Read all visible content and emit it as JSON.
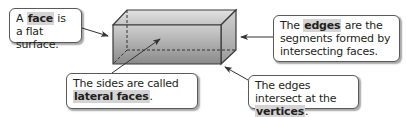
{
  "diagram": {
    "callouts": {
      "face": {
        "pre": "A ",
        "term": "face",
        "post": " is a flat surface."
      },
      "edges": {
        "pre": "The ",
        "term": "edges",
        "post": " are the segments formed by intersecting faces."
      },
      "lateral": {
        "pre": "The sides are called ",
        "term": "lateral faces",
        "post": "."
      },
      "vertices": {
        "pre": "The edges intersect at the ",
        "term": "vertices",
        "post": "."
      }
    },
    "colors": {
      "outline": "#3a3a3a",
      "highlight": "#d4d4d4",
      "box_front_top": "#c9c9c9",
      "box_front_bottom": "#8c8c8c"
    }
  }
}
